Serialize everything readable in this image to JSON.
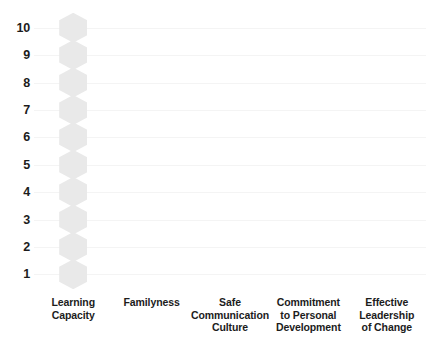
{
  "chart_data": {
    "type": "bar",
    "title": "",
    "subtitle": "",
    "xlabel": "",
    "ylabel": "",
    "grid": true,
    "legend": null,
    "ylim": [
      1,
      10
    ],
    "yticks": [
      "10",
      "9",
      "8",
      "7",
      "6",
      "5",
      "4",
      "3",
      "2",
      "1"
    ],
    "categories": [
      "Learning Capacity",
      "Familyness",
      "Safe Communication Culture",
      "Commitment to Personal Development",
      "Effective Leadership of Change"
    ],
    "category_lines": [
      [
        "Learning",
        "Capacity"
      ],
      [
        "Familyness"
      ],
      [
        "Safe",
        "Communication",
        "Culture"
      ],
      [
        "Commitment",
        "to Personal",
        "Development"
      ],
      [
        "Effective",
        "Leadership",
        "of Change"
      ]
    ],
    "series": [
      {
        "name": "Score",
        "marker": "hexagon",
        "values": [
          10,
          0,
          0,
          0,
          0
        ]
      }
    ],
    "marker_levels": [
      10,
      9,
      8,
      7,
      6,
      5,
      4,
      3,
      2,
      1
    ],
    "colors": {
      "marker": "#e9e9e9",
      "gridline": "#f4f4f4",
      "text": "#1c1c1c",
      "background": "#ffffff"
    }
  }
}
